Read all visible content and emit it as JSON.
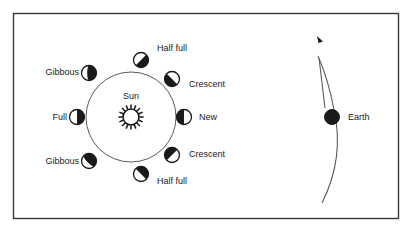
{
  "figure": {
    "type": "diagram",
    "frame": {
      "x": 13,
      "y": 13,
      "width": 385,
      "height": 205,
      "border_color": "#3a3a3a"
    },
    "background": "#ffffff",
    "line_color": "#5a5a5a",
    "dark_color": "#1a1a1a",
    "light_color": "#ffffff"
  },
  "sun": {
    "label": "Sun",
    "cx": 131,
    "cy": 117,
    "radius": 8,
    "ray_count": 16,
    "label_x": 131,
    "label_y": 99
  },
  "orbit": {
    "cx": 131,
    "cy": 117,
    "radius": 45
  },
  "moons": [
    {
      "id": "half-full-top",
      "label": "Half full",
      "cx": 141,
      "cy": 60,
      "r": 7.5,
      "dark_side": "upper-left",
      "fraction": 0.5,
      "label_x": 157,
      "label_y": 51,
      "anchor": "start"
    },
    {
      "id": "gibbous-upper-left",
      "label": "Gibbous",
      "cx": 89,
      "cy": 73,
      "r": 7.5,
      "dark_side": "left",
      "fraction": 0.62,
      "label_x": 79,
      "label_y": 75,
      "anchor": "end"
    },
    {
      "id": "full-left",
      "label": "Full",
      "cx": 77,
      "cy": 117,
      "r": 7.5,
      "dark_side": "left",
      "fraction": 0.5,
      "label_x": 67,
      "label_y": 120,
      "anchor": "end"
    },
    {
      "id": "gibbous-lower-left",
      "label": "Gibbous",
      "cx": 89,
      "cy": 161,
      "r": 7.5,
      "dark_side": "lower-left",
      "fraction": 0.62,
      "label_x": 79,
      "label_y": 164,
      "anchor": "end"
    },
    {
      "id": "half-full-bottom",
      "label": "Half full",
      "cx": 141,
      "cy": 174,
      "r": 7.5,
      "dark_side": "lower-left",
      "fraction": 0.5,
      "label_x": 157,
      "label_y": 184,
      "anchor": "start"
    },
    {
      "id": "crescent-lower-right",
      "label": "Crescent",
      "cx": 172,
      "cy": 155,
      "r": 7.5,
      "dark_side": "lower-right",
      "fraction": 0.5,
      "label_x": 189,
      "label_y": 157,
      "anchor": "start"
    },
    {
      "id": "new-right",
      "label": "New",
      "cx": 184,
      "cy": 117,
      "r": 7.5,
      "dark_side": "right",
      "fraction": 0.5,
      "label_x": 199,
      "label_y": 120,
      "anchor": "start"
    },
    {
      "id": "crescent-upper-right",
      "label": "Crescent",
      "cx": 172,
      "cy": 79,
      "r": 7.5,
      "dark_side": "upper-right",
      "fraction": 0.5,
      "label_x": 189,
      "label_y": 87,
      "anchor": "start"
    }
  ],
  "earth": {
    "label": "Earth",
    "cx": 332,
    "cy": 117,
    "radius": 7.5,
    "label_x": 348,
    "label_y": 120
  },
  "earth_orbit": {
    "arrow_label": "orbit-direction-arrow",
    "path": "M 322 203 C 336 175 342 145 334 110 C 330 88 325 72 318 56",
    "inner_path": "M 325 108 C 323 92 321 74 319 58",
    "arrow_tip_x": 317,
    "arrow_tip_y": 36
  }
}
